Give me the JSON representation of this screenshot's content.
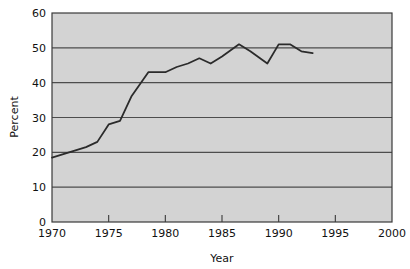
{
  "chart_data": {
    "type": "line",
    "title": "",
    "subtitle": "",
    "xlabel": "Year",
    "ylabel": "Percent",
    "xlim": [
      1970,
      2000
    ],
    "ylim": [
      0,
      60
    ],
    "grid": true,
    "grid_axis": "y",
    "legend": false,
    "legend_position": "none",
    "x_ticks": [
      1970,
      1975,
      1980,
      1985,
      1990,
      1995,
      2000
    ],
    "x_tick_labels": [
      "1970",
      "1975",
      "1980",
      "1985",
      "1990",
      "1995",
      "2000"
    ],
    "y_ticks": [
      0,
      10,
      20,
      30,
      40,
      50,
      60
    ],
    "y_tick_labels": [
      "0",
      "10",
      "20",
      "30",
      "40",
      "50",
      "60"
    ],
    "series": [
      {
        "name": "Percent",
        "color": "#2b2b2b",
        "x": [
          1970,
          1971,
          1972,
          1973,
          1974,
          1975,
          1976,
          1977,
          1978.5,
          1980,
          1981,
          1982,
          1983,
          1984,
          1985,
          1986.5,
          1987.5,
          1989,
          1990,
          1991,
          1992,
          1993
        ],
        "values": [
          18.5,
          19.5,
          20.5,
          21.5,
          23.0,
          28.0,
          29.0,
          36.0,
          43.0,
          43.0,
          44.5,
          45.5,
          47.0,
          45.5,
          47.5,
          51.0,
          49.0,
          45.5,
          51.0,
          51.0,
          49.0,
          48.5
        ]
      }
    ]
  },
  "plot": {
    "background_color": "#d3d3d3",
    "gridline_color": "#4d4d4d",
    "border_color": "#3a3a3a",
    "line_color": "#2b2b2b",
    "line_width": 1.8,
    "page_background": "#ffffff"
  },
  "geometry": {
    "left": 52,
    "right": 392,
    "top": 13,
    "bottom": 222
  }
}
